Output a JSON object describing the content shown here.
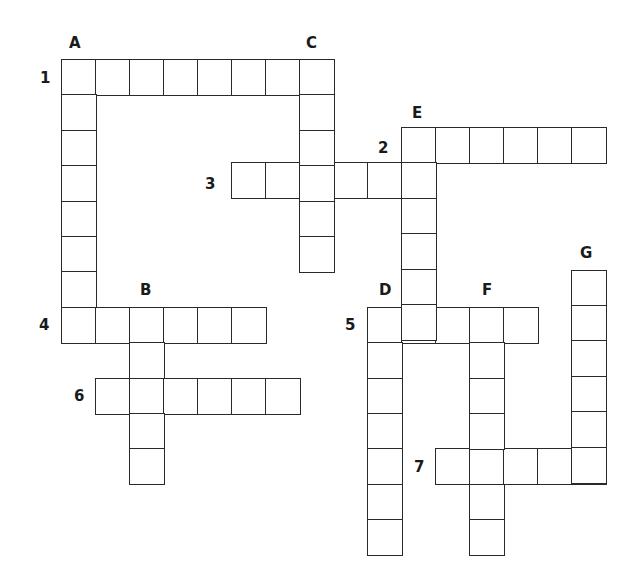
{
  "puzzle": {
    "type": "crossword",
    "cell_width": 34,
    "cell_height": 35.4,
    "origin_x": 61,
    "origin_y": 59,
    "line_color": "#2a2a2a",
    "words": [
      {
        "id": "1",
        "direction": "across",
        "row": 0,
        "col": 0,
        "length": 8
      },
      {
        "id": "2",
        "direction": "across",
        "row": 1.92,
        "col": 10,
        "length": 6
      },
      {
        "id": "3",
        "direction": "across",
        "row": 2.92,
        "col": 5,
        "length": 6
      },
      {
        "id": "4",
        "direction": "across",
        "row": 7,
        "col": 0,
        "length": 6
      },
      {
        "id": "5",
        "direction": "across",
        "row": 7,
        "col": 9,
        "length": 5
      },
      {
        "id": "6",
        "direction": "across",
        "row": 9,
        "col": 1,
        "length": 6
      },
      {
        "id": "7",
        "direction": "across",
        "row": 11,
        "col": 11,
        "length": 5
      },
      {
        "id": "A",
        "direction": "down",
        "row": 0,
        "col": 0,
        "length": 8
      },
      {
        "id": "B",
        "direction": "down",
        "row": 7,
        "col": 2,
        "length": 5
      },
      {
        "id": "C",
        "direction": "down",
        "row": 0,
        "col": 7,
        "length": 6
      },
      {
        "id": "D",
        "direction": "down",
        "row": 7,
        "col": 9,
        "length": 7
      },
      {
        "id": "E",
        "direction": "down",
        "row": 1.92,
        "col": 10,
        "length": 6
      },
      {
        "id": "F",
        "direction": "down",
        "row": 7,
        "col": 12,
        "length": 7
      },
      {
        "id": "G",
        "direction": "down",
        "row": 5.95,
        "col": 15,
        "length": 6
      }
    ],
    "labels": [
      {
        "text": "A",
        "x": 69,
        "y": 36
      },
      {
        "text": "C",
        "x": 306,
        "y": 36
      },
      {
        "text": "1",
        "x": 40,
        "y": 71
      },
      {
        "text": "E",
        "x": 412,
        "y": 106
      },
      {
        "text": "2",
        "x": 378,
        "y": 141
      },
      {
        "text": "3",
        "x": 205,
        "y": 177
      },
      {
        "text": "G",
        "x": 580,
        "y": 246
      },
      {
        "text": "B",
        "x": 140,
        "y": 283
      },
      {
        "text": "D",
        "x": 379,
        "y": 283
      },
      {
        "text": "F",
        "x": 482,
        "y": 283
      },
      {
        "text": "4",
        "x": 39,
        "y": 318
      },
      {
        "text": "5",
        "x": 345,
        "y": 318
      },
      {
        "text": "6",
        "x": 74,
        "y": 389
      },
      {
        "text": "7",
        "x": 414,
        "y": 460
      }
    ]
  }
}
